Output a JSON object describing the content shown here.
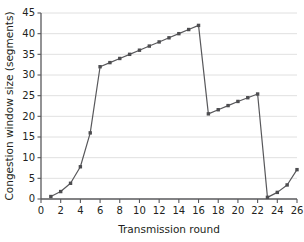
{
  "chart_data": {
    "type": "line",
    "title": "",
    "xlabel": "Transmission round",
    "ylabel": "Congestion window size (segments)",
    "xlim": [
      0,
      26
    ],
    "ylim": [
      0,
      45
    ],
    "xticks": [
      0,
      2,
      4,
      6,
      8,
      10,
      12,
      14,
      16,
      18,
      20,
      22,
      24,
      26
    ],
    "yticks": [
      0,
      5,
      10,
      15,
      20,
      25,
      30,
      35,
      40,
      45
    ],
    "grid": "horizontal",
    "legend": "none",
    "marker": "square",
    "line_color": "#58585b",
    "marker_color": "#4d4d50",
    "grid_color": "#d8d8d8",
    "series": [
      {
        "name": "congestion window",
        "x": [
          1,
          2,
          3,
          4,
          5,
          6,
          7,
          8,
          9,
          10,
          11,
          12,
          13,
          14,
          15,
          16,
          17,
          18,
          19,
          20,
          21,
          22,
          23,
          24,
          25,
          26
        ],
        "values": [
          0.6,
          1.8,
          3.8,
          7.8,
          16.0,
          32.0,
          33.0,
          34.0,
          35.0,
          36.0,
          37.0,
          38.0,
          39.0,
          40.0,
          41.0,
          42.0,
          20.6,
          21.6,
          22.6,
          23.6,
          24.5,
          25.4,
          0.4,
          1.6,
          3.4,
          7.1
        ]
      }
    ]
  },
  "figure": {
    "xlabel": "Transmission round",
    "ylabel": "Congestion window size (segments)"
  }
}
